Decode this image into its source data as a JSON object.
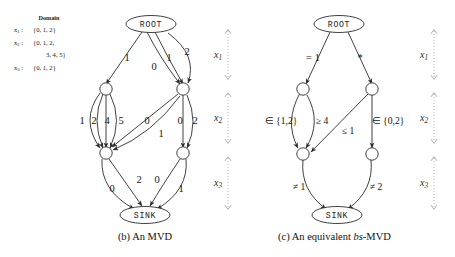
{
  "figure": {
    "domain_legend": {
      "title": "Domain",
      "entries": [
        {
          "var": "x",
          "sub": "1",
          "sep": ":",
          "value": "{0, 1, 2}"
        },
        {
          "var": "x",
          "sub": "2",
          "sep": ":",
          "value": "{0, 1, 2,"
        },
        {
          "var": "",
          "sub": "",
          "sep": "",
          "value": "3, 4, 5}"
        },
        {
          "var": "x",
          "sub": "3",
          "sep": ":",
          "value": "{0, 1, 2}"
        }
      ]
    },
    "layer_labels": [
      {
        "var": "x",
        "sub": "1"
      },
      {
        "var": "x",
        "sub": "2"
      },
      {
        "var": "x",
        "sub": "3"
      }
    ],
    "panels": [
      {
        "id": "panel-b",
        "caption_prefix": "(b) An MVD",
        "caption_italic": "",
        "caption_suffix": "",
        "root_label": "ROOT",
        "sink_label": "SINK",
        "edge_labels": [
          "1",
          "0",
          "1",
          "2",
          "1",
          "2",
          "4",
          "5",
          "0",
          "1",
          "0",
          "2",
          "0",
          "2",
          "0",
          "1"
        ]
      },
      {
        "id": "panel-c",
        "caption_prefix": "(c) An equivalent ",
        "caption_italic": "bs",
        "caption_suffix": "-MVD",
        "root_label": "ROOT",
        "sink_label": "SINK",
        "edge_labels": [
          "= 1",
          "*",
          "∈ {1,2}",
          "≥ 4",
          "≤ 1",
          "∈ {0,2}",
          "≠ 1",
          "≠ 2"
        ]
      }
    ]
  }
}
